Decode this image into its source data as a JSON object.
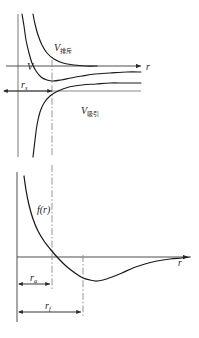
{
  "figure": {
    "title": "",
    "background_color": "#ffffff",
    "curve_color": "#1a1a1a",
    "axis_color": "#3a3a3a",
    "guide_color": "#8a8a8a"
  },
  "panels": [
    {
      "id": "potential-panel",
      "name": "intermolecular-potential-energy-plot",
      "axis_label": "r",
      "curve_labels": [
        {
          "base": "V",
          "subscript": "排斥",
          "name": "v-repulsive-label"
        },
        {
          "base": "V",
          "subscript": "吸引",
          "name": "v-attractive-label"
        },
        {
          "base": "V",
          "subscript": "",
          "name": "v-total-label"
        }
      ],
      "measure_labels": [
        {
          "base": "r",
          "subscript": "s",
          "name": "r-s-measure-label"
        }
      ]
    },
    {
      "id": "force-panel",
      "name": "intermolecular-force-plot",
      "axis_label": "r",
      "curve_labels": [
        {
          "base": "f(r)",
          "subscript": "",
          "name": "f-of-r-label"
        }
      ],
      "measure_labels": [
        {
          "base": "r",
          "subscript": "a",
          "name": "r-a-measure-label"
        },
        {
          "base": "r",
          "subscript": "f",
          "name": "r-f-measure-label"
        }
      ]
    }
  ],
  "chart_data": {
    "type": "line",
    "xlabel": "r",
    "ylabel": "",
    "grid": false,
    "legend_position": "inline-annotations",
    "subplots": [
      {
        "name": "potential-energy",
        "ylabel": "V",
        "xlim": [
          0,
          199
        ],
        "ylim": [
          -60,
          60
        ],
        "zero_line_y": 66,
        "series": [
          {
            "name": "V_repulsive",
            "label": "V排斥",
            "description": "positive repulsive branch, decays from +infinity toward zero",
            "style": "solid",
            "points": [
              [
                33,
                14
              ],
              [
                35,
                24
              ],
              [
                38,
                35
              ],
              [
                42,
                45
              ],
              [
                47,
                53
              ],
              [
                54,
                59
              ],
              [
                63,
                63
              ],
              [
                74,
                65
              ],
              [
                86,
                66
              ],
              [
                97,
                66
              ]
            ]
          },
          {
            "name": "V_attractive",
            "label": "V吸引",
            "description": "negative attractive branch, rises from -infinity toward zero",
            "style": "solid",
            "points": [
              [
                33,
                157
              ],
              [
                35,
                140
              ],
              [
                37,
                125
              ],
              [
                40,
                112
              ],
              [
                44,
                103
              ],
              [
                50,
                96
              ],
              [
                58,
                91
              ],
              [
                69,
                87
              ],
              [
                82,
                85
              ],
              [
                96,
                84
              ],
              [
                110,
                83
              ],
              [
                124,
                83
              ],
              [
                141,
                83
              ]
            ]
          },
          {
            "name": "V_total",
            "label": "V",
            "description": "resultant potential with minimum near r_s",
            "style": "solid",
            "points": [
              [
                22,
                14
              ],
              [
                24,
                26
              ],
              [
                26,
                40
              ],
              [
                29,
                53
              ],
              [
                32,
                63
              ],
              [
                36,
                71
              ],
              [
                41,
                77
              ],
              [
                47,
                80
              ],
              [
                53,
                81
              ],
              [
                61,
                80
              ],
              [
                71,
                78
              ],
              [
                82,
                76
              ],
              [
                95,
                74
              ],
              [
                110,
                73
              ],
              [
                127,
                72
              ],
              [
                141,
                72
              ]
            ]
          }
        ],
        "annotations": [
          {
            "text": "V排斥",
            "x": 57,
            "y": 47
          },
          {
            "text": "V",
            "x": 29,
            "y": 67
          },
          {
            "text": "V吸引",
            "x": 84,
            "y": 110
          },
          {
            "text": "r",
            "x": 146,
            "y": 70
          }
        ],
        "measures": [
          {
            "label": "r_s",
            "from_x": 4,
            "to_x": 52,
            "y": 91,
            "tick_label": "rₛ"
          }
        ],
        "reference_lines": [
          {
            "type": "vertical",
            "x": 18,
            "style": "solid",
            "color": "#6a6a6a"
          },
          {
            "type": "vertical",
            "x": 52,
            "style": "dash-dot",
            "color": "#8a8a8a"
          },
          {
            "type": "horizontal",
            "y": 66,
            "style": "solid",
            "color": "#3a3a3a"
          },
          {
            "type": "horizontal",
            "y": 91,
            "style": "solid",
            "color": "#6a6a6a"
          }
        ]
      },
      {
        "name": "force",
        "ylabel": "f(r)",
        "xlim": [
          0,
          199
        ],
        "ylim": [
          -40,
          80
        ],
        "zero_line_y": 257,
        "series": [
          {
            "name": "f_total",
            "label": "f(r)",
            "description": "resultant force: strongly repulsive at small r, crosses zero at r_a, minimum at r_f, then decays to zero",
            "style": "solid",
            "points": [
              [
                24,
                176
              ],
              [
                26,
                190
              ],
              [
                29,
                205
              ],
              [
                33,
                219
              ],
              [
                38,
                231
              ],
              [
                44,
                241
              ],
              [
                51,
                250
              ],
              [
                58,
                258
              ],
              [
                66,
                266
              ],
              [
                75,
                273
              ],
              [
                83,
                278
              ],
              [
                90,
                280
              ],
              [
                96,
                281
              ],
              [
                103,
                280
              ],
              [
                112,
                277
              ],
              [
                122,
                273
              ],
              [
                133,
                268
              ],
              [
                145,
                264
              ],
              [
                157,
                261
              ],
              [
                170,
                259
              ],
              [
                182,
                258
              ],
              [
                190,
                257
              ]
            ]
          }
        ],
        "annotations": [
          {
            "text": "f(r)",
            "x": 41,
            "y": 210
          },
          {
            "text": "r",
            "x": 176,
            "y": 264
          }
        ],
        "measures": [
          {
            "label": "r_a",
            "from_x": 17,
            "to_x": 52,
            "y": 284,
            "tick_label": "rₐ"
          },
          {
            "label": "r_f",
            "from_x": 17,
            "to_x": 83,
            "y": 312,
            "tick_label": "r_f"
          }
        ],
        "reference_lines": [
          {
            "type": "vertical",
            "x": 17,
            "style": "solid",
            "color": "#3a3a3a"
          },
          {
            "type": "vertical",
            "x": 52,
            "style": "dash-dot",
            "color": "#8a8a8a"
          },
          {
            "type": "vertical",
            "x": 83,
            "style": "dash-dot",
            "color": "#8a8a8a"
          },
          {
            "type": "horizontal",
            "y": 257,
            "style": "solid",
            "color": "#3a3a3a"
          }
        ]
      }
    ]
  }
}
